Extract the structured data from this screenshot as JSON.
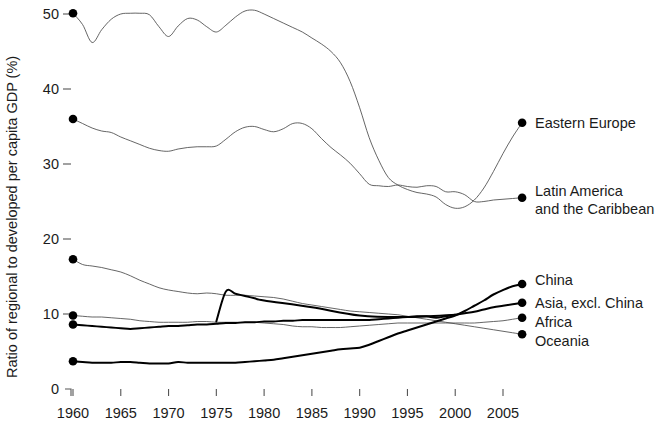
{
  "chart_data": {
    "type": "line",
    "title": "",
    "xlabel": "",
    "ylabel": "Ratio of regional to developed per capita GDP (%)",
    "xlim": [
      1960,
      2007
    ],
    "ylim": [
      0,
      52
    ],
    "grid": false,
    "legend_position": "right-inline-labels",
    "x_ticks": [
      "1960",
      "1965",
      "1970",
      "1975",
      "1980",
      "1985",
      "1990",
      "1995",
      "2000",
      "2005"
    ],
    "x_tick_values": [
      1960,
      1965,
      1970,
      1975,
      1980,
      1985,
      1990,
      1995,
      2000,
      2005
    ],
    "y_ticks": [
      "0",
      "10",
      "20",
      "30",
      "40",
      "50"
    ],
    "y_tick_values": [
      0,
      10,
      20,
      30,
      40,
      50
    ],
    "series": [
      {
        "name": "Eastern Europe",
        "style": "thin",
        "start_marker": true,
        "end_marker": true,
        "x": [
          1960,
          1961,
          1962,
          1963,
          1964,
          1965,
          1966,
          1967,
          1968,
          1969,
          1970,
          1971,
          1972,
          1973,
          1974,
          1975,
          1976,
          1977,
          1978,
          1979,
          1980,
          1981,
          1982,
          1983,
          1984,
          1985,
          1986,
          1987,
          1988,
          1989,
          1990,
          1991,
          1992,
          1993,
          1994,
          1995,
          1996,
          1997,
          1998,
          1999,
          2000,
          2001,
          2002,
          2003,
          2004,
          2005,
          2006,
          2007
        ],
        "values": [
          50.1,
          48.6,
          46.2,
          47.9,
          49.3,
          50.0,
          50.1,
          50.1,
          49.9,
          48.3,
          47.0,
          48.4,
          49.4,
          49.2,
          48.3,
          47.6,
          48.5,
          49.6,
          50.4,
          50.5,
          50.0,
          49.4,
          48.8,
          48.2,
          47.6,
          46.8,
          46.0,
          45.0,
          43.5,
          41.0,
          37.5,
          33.5,
          30.5,
          28.2,
          27.2,
          26.6,
          26.2,
          26.0,
          25.6,
          24.6,
          24.1,
          24.3,
          25.2,
          26.8,
          29.0,
          31.4,
          33.6,
          35.5
        ]
      },
      {
        "name": "Latin America\nand the Caribbean",
        "label_line1": "Latin America",
        "label_line2": "and the Caribbean",
        "style": "thin",
        "start_marker": true,
        "end_marker": true,
        "x": [
          1960,
          1961,
          1962,
          1963,
          1964,
          1965,
          1966,
          1967,
          1968,
          1969,
          1970,
          1971,
          1972,
          1973,
          1974,
          1975,
          1976,
          1977,
          1978,
          1979,
          1980,
          1981,
          1982,
          1983,
          1984,
          1985,
          1986,
          1987,
          1988,
          1989,
          1990,
          1991,
          1992,
          1993,
          1994,
          1995,
          1996,
          1997,
          1998,
          1999,
          2000,
          2001,
          2002,
          2003,
          2004,
          2005,
          2006,
          2007
        ],
        "values": [
          36.0,
          35.4,
          34.8,
          34.4,
          34.2,
          33.6,
          33.1,
          32.6,
          32.1,
          31.8,
          31.7,
          32.0,
          32.2,
          32.3,
          32.3,
          32.4,
          33.3,
          34.3,
          34.9,
          35.0,
          34.6,
          34.3,
          34.7,
          35.4,
          35.4,
          34.7,
          33.4,
          32.2,
          31.2,
          30.1,
          28.7,
          27.3,
          27.1,
          27.0,
          27.2,
          27.0,
          26.9,
          27.1,
          27.0,
          26.3,
          26.3,
          25.9,
          25.0,
          25.0,
          25.2,
          25.3,
          25.4,
          25.5
        ]
      },
      {
        "name": "Oceania",
        "style": "thin",
        "start_marker": true,
        "end_marker": true,
        "x": [
          1960,
          1961,
          1962,
          1963,
          1964,
          1965,
          1966,
          1967,
          1968,
          1969,
          1970,
          1971,
          1972,
          1973,
          1974,
          1975,
          1976,
          1977,
          1978,
          1979,
          1980,
          1981,
          1982,
          1983,
          1984,
          1985,
          1986,
          1987,
          1988,
          1989,
          1990,
          1991,
          1992,
          1993,
          1994,
          1995,
          1996,
          1997,
          1998,
          1999,
          2000,
          2001,
          2002,
          2003,
          2004,
          2005,
          2006,
          2007
        ],
        "values": [
          17.3,
          16.6,
          16.4,
          16.2,
          15.9,
          15.6,
          15.1,
          14.5,
          14.0,
          13.5,
          13.2,
          13.0,
          12.8,
          12.7,
          12.8,
          12.7,
          12.5,
          12.5,
          12.5,
          12.4,
          12.3,
          12.2,
          12.0,
          11.7,
          11.4,
          11.2,
          11.0,
          10.8,
          10.6,
          10.4,
          10.3,
          10.2,
          10.1,
          10.0,
          9.9,
          9.7,
          9.5,
          9.3,
          9.1,
          8.9,
          8.7,
          8.5,
          8.3,
          8.1,
          7.9,
          7.7,
          7.5,
          7.3
        ]
      },
      {
        "name": "Africa",
        "style": "thin",
        "start_marker": true,
        "end_marker": true,
        "x": [
          1960,
          1961,
          1962,
          1963,
          1964,
          1965,
          1966,
          1967,
          1968,
          1969,
          1970,
          1971,
          1972,
          1973,
          1974,
          1975,
          1976,
          1977,
          1978,
          1979,
          1980,
          1981,
          1982,
          1983,
          1984,
          1985,
          1986,
          1987,
          1988,
          1989,
          1990,
          1991,
          1992,
          1993,
          1994,
          1995,
          1996,
          1997,
          1998,
          1999,
          2000,
          2001,
          2002,
          2003,
          2004,
          2005,
          2006,
          2007
        ],
        "values": [
          9.8,
          9.7,
          9.6,
          9.6,
          9.5,
          9.4,
          9.3,
          9.1,
          9.0,
          8.9,
          8.9,
          8.9,
          8.9,
          9.0,
          9.0,
          8.9,
          8.9,
          8.9,
          8.9,
          8.9,
          8.8,
          8.7,
          8.6,
          8.4,
          8.3,
          8.3,
          8.2,
          8.2,
          8.2,
          8.3,
          8.4,
          8.5,
          8.6,
          8.7,
          8.8,
          8.8,
          8.8,
          8.8,
          8.8,
          8.8,
          8.8,
          8.8,
          8.8,
          8.9,
          9.0,
          9.1,
          9.3,
          9.5
        ]
      },
      {
        "name": "Asia, excl. China",
        "style": "thick",
        "start_marker": true,
        "end_marker": true,
        "x": [
          1960,
          1961,
          1962,
          1963,
          1964,
          1965,
          1966,
          1967,
          1968,
          1969,
          1970,
          1971,
          1972,
          1973,
          1974,
          1975,
          1976,
          1977,
          1978,
          1979,
          1980,
          1981,
          1982,
          1983,
          1984,
          1985,
          1986,
          1987,
          1988,
          1989,
          1990,
          1991,
          1992,
          1993,
          1994,
          1995,
          1996,
          1997,
          1998,
          1999,
          2000,
          2001,
          2002,
          2003,
          2004,
          2005,
          2006,
          2007
        ],
        "values": [
          8.6,
          8.5,
          8.4,
          8.3,
          8.2,
          8.1,
          8.0,
          8.1,
          8.2,
          8.3,
          8.4,
          8.4,
          8.5,
          8.6,
          8.6,
          8.7,
          8.8,
          8.8,
          8.9,
          8.9,
          9.0,
          9.0,
          9.1,
          9.1,
          9.2,
          9.2,
          9.2,
          9.2,
          9.2,
          9.2,
          9.2,
          9.2,
          9.3,
          9.4,
          9.5,
          9.6,
          9.7,
          9.7,
          9.5,
          9.7,
          9.9,
          10.1,
          10.3,
          10.6,
          10.9,
          11.1,
          11.3,
          11.5
        ]
      },
      {
        "name": "China",
        "style": "thick",
        "start_marker": true,
        "end_marker": true,
        "x": [
          1960,
          1961,
          1962,
          1963,
          1964,
          1965,
          1966,
          1967,
          1968,
          1969,
          1970,
          1971,
          1972,
          1973,
          1974,
          1975,
          1976,
          1977,
          1978,
          1979,
          1980,
          1981,
          1982,
          1983,
          1984,
          1985,
          1986,
          1987,
          1988,
          1989,
          1990,
          1991,
          1992,
          1993,
          1994,
          1995,
          1996,
          1997,
          1998,
          1999,
          2000,
          2001,
          2002,
          2003,
          2004,
          2005,
          2006,
          2007
        ],
        "values": [
          3.7,
          3.6,
          3.5,
          3.5,
          3.5,
          3.6,
          3.6,
          3.5,
          3.4,
          3.4,
          3.4,
          3.6,
          3.5,
          3.5,
          3.5,
          3.5,
          3.5,
          3.5,
          3.6,
          3.7,
          3.8,
          3.9,
          4.1,
          4.3,
          4.5,
          4.7,
          4.9,
          5.1,
          5.3,
          5.4,
          5.5,
          5.9,
          6.4,
          6.9,
          7.4,
          7.8,
          8.2,
          8.6,
          9.0,
          9.4,
          9.8,
          10.4,
          11.1,
          11.8,
          12.6,
          13.2,
          13.7,
          14.0
        ]
      },
      {
        "name": "China early (spike segment)",
        "style": "thick",
        "note": "sharp jump near 1976 visible in source",
        "x": [
          1975,
          1976,
          1977,
          1978,
          1979,
          1980,
          1985,
          1990,
          1995,
          2000
        ],
        "values": [
          9.0,
          13.0,
          12.7,
          12.4,
          12.1,
          11.8,
          10.9,
          9.8,
          9.6,
          9.9
        ]
      }
    ]
  },
  "labels": {
    "eastern_europe": "Eastern Europe",
    "latin_america_1": "Latin America",
    "latin_america_2": "and the Caribbean",
    "china": "China",
    "asia": "Asia, excl. China",
    "africa": "Africa",
    "oceania": "Oceania"
  }
}
